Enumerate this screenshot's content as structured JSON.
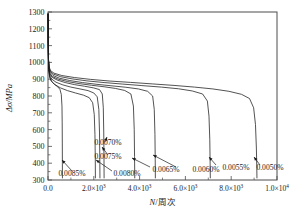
{
  "chart_data": {
    "type": "line",
    "title": "",
    "xlabel": "N/周次",
    "ylabel": "Δσ/MPa",
    "xlim": [
      0,
      10000
    ],
    "ylim": [
      300,
      1300
    ],
    "grid": false,
    "legend_position": "inline-annotations",
    "x_ticks": [
      {
        "value": 0,
        "label": "0.0"
      },
      {
        "value": 2000,
        "label": "2.0×10",
        "exp": "3"
      },
      {
        "value": 4000,
        "label": "4.0×10",
        "exp": "3"
      },
      {
        "value": 6000,
        "label": "6.0×10",
        "exp": "3"
      },
      {
        "value": 8000,
        "label": "8.0×10",
        "exp": "3"
      },
      {
        "value": 10000,
        "label": "1.0×10",
        "exp": "4"
      }
    ],
    "y_ticks": [
      {
        "value": 300,
        "label": "300"
      },
      {
        "value": 400,
        "label": "400"
      },
      {
        "value": 500,
        "label": "500"
      },
      {
        "value": 600,
        "label": "600"
      },
      {
        "value": 700,
        "label": "700"
      },
      {
        "value": 800,
        "label": "800"
      },
      {
        "value": 900,
        "label": "900"
      },
      {
        "value": 1000,
        "label": "1000"
      },
      {
        "value": 1100,
        "label": "1100"
      },
      {
        "value": 1200,
        "label": "1200"
      },
      {
        "value": 1300,
        "label": "1300"
      }
    ],
    "series": [
      {
        "name": "0.0085%",
        "label": "0.0085%",
        "failure_cycles": 620,
        "points": [
          [
            5,
            1290
          ],
          [
            12,
            1120
          ],
          [
            22,
            1010
          ],
          [
            40,
            950
          ],
          [
            70,
            915
          ],
          [
            120,
            895
          ],
          [
            200,
            880
          ],
          [
            300,
            868
          ],
          [
            420,
            855
          ],
          [
            520,
            840
          ],
          [
            580,
            810
          ],
          [
            610,
            740
          ],
          [
            620,
            640
          ],
          [
            625,
            520
          ],
          [
            628,
            400
          ],
          [
            630,
            310
          ]
        ]
      },
      {
        "name": "0.0080%",
        "label": "0.0080%",
        "failure_cycles": 2050,
        "points": [
          [
            5,
            1290
          ],
          [
            12,
            1120
          ],
          [
            22,
            1010
          ],
          [
            40,
            950
          ],
          [
            75,
            912
          ],
          [
            150,
            888
          ],
          [
            300,
            868
          ],
          [
            550,
            848
          ],
          [
            850,
            832
          ],
          [
            1200,
            818
          ],
          [
            1550,
            805
          ],
          [
            1800,
            790
          ],
          [
            1950,
            760
          ],
          [
            2020,
            690
          ],
          [
            2050,
            570
          ],
          [
            2065,
            430
          ],
          [
            2070,
            310
          ]
        ]
      },
      {
        "name": "0.0075%",
        "label": "0.0075%",
        "failure_cycles": 2250,
        "points": [
          [
            5,
            1290
          ],
          [
            12,
            1120
          ],
          [
            22,
            1010
          ],
          [
            40,
            955
          ],
          [
            80,
            920
          ],
          [
            170,
            900
          ],
          [
            350,
            882
          ],
          [
            650,
            866
          ],
          [
            1000,
            853
          ],
          [
            1400,
            842
          ],
          [
            1750,
            832
          ],
          [
            2000,
            818
          ],
          [
            2150,
            795
          ],
          [
            2220,
            720
          ],
          [
            2250,
            580
          ],
          [
            2262,
            430
          ],
          [
            2268,
            310
          ]
        ]
      },
      {
        "name": "0.0070%",
        "label": "0.0070%",
        "failure_cycles": 2420,
        "points": [
          [
            5,
            1290
          ],
          [
            12,
            1120
          ],
          [
            22,
            1012
          ],
          [
            42,
            960
          ],
          [
            85,
            928
          ],
          [
            190,
            910
          ],
          [
            400,
            895
          ],
          [
            750,
            880
          ],
          [
            1150,
            868
          ],
          [
            1600,
            858
          ],
          [
            2000,
            848
          ],
          [
            2250,
            838
          ],
          [
            2370,
            812
          ],
          [
            2415,
            730
          ],
          [
            2435,
            580
          ],
          [
            2445,
            430
          ],
          [
            2450,
            310
          ]
        ]
      },
      {
        "name": "0.0065%",
        "label": "0.0065%",
        "failure_cycles": 3750,
        "points": [
          [
            5,
            1290
          ],
          [
            12,
            1120
          ],
          [
            22,
            1012
          ],
          [
            42,
            962
          ],
          [
            90,
            932
          ],
          [
            200,
            915
          ],
          [
            450,
            900
          ],
          [
            850,
            886
          ],
          [
            1350,
            874
          ],
          [
            1900,
            864
          ],
          [
            2450,
            855
          ],
          [
            2950,
            845
          ],
          [
            3350,
            833
          ],
          [
            3620,
            812
          ],
          [
            3730,
            740
          ],
          [
            3765,
            600
          ],
          [
            3780,
            440
          ],
          [
            3788,
            310
          ]
        ]
      },
      {
        "name": "0.0060%",
        "label": "0.0060%",
        "failure_cycles": 4650,
        "points": [
          [
            5,
            1290
          ],
          [
            12,
            1120
          ],
          [
            22,
            1014
          ],
          [
            45,
            968
          ],
          [
            95,
            940
          ],
          [
            220,
            922
          ],
          [
            500,
            906
          ],
          [
            950,
            892
          ],
          [
            1500,
            880
          ],
          [
            2100,
            870
          ],
          [
            2750,
            861
          ],
          [
            3400,
            852
          ],
          [
            3950,
            842
          ],
          [
            4350,
            828
          ],
          [
            4570,
            800
          ],
          [
            4640,
            720
          ],
          [
            4670,
            570
          ],
          [
            4682,
            420
          ],
          [
            4688,
            310
          ]
        ]
      },
      {
        "name": "0.0055%",
        "label": "0.0055%",
        "failure_cycles": 7050,
        "points": [
          [
            5,
            1290
          ],
          [
            12,
            1120
          ],
          [
            22,
            1016
          ],
          [
            45,
            972
          ],
          [
            100,
            946
          ],
          [
            240,
            930
          ],
          [
            550,
            915
          ],
          [
            1050,
            902
          ],
          [
            1700,
            890
          ],
          [
            2450,
            880
          ],
          [
            3250,
            871
          ],
          [
            4100,
            862
          ],
          [
            4950,
            853
          ],
          [
            5700,
            843
          ],
          [
            6300,
            830
          ],
          [
            6750,
            812
          ],
          [
            6960,
            770
          ],
          [
            7030,
            680
          ],
          [
            7065,
            540
          ],
          [
            7080,
            400
          ],
          [
            7088,
            310
          ]
        ]
      },
      {
        "name": "0.0050%",
        "label": "0.0050%",
        "failure_cycles": 9000,
        "points": [
          [
            5,
            1290
          ],
          [
            12,
            1120
          ],
          [
            22,
            1018
          ],
          [
            45,
            976
          ],
          [
            105,
            952
          ],
          [
            260,
            936
          ],
          [
            600,
            922
          ],
          [
            1150,
            910
          ],
          [
            1850,
            899
          ],
          [
            2700,
            889
          ],
          [
            3600,
            881
          ],
          [
            4550,
            872
          ],
          [
            5500,
            863
          ],
          [
            6400,
            853
          ],
          [
            7200,
            842
          ],
          [
            7900,
            828
          ],
          [
            8450,
            810
          ],
          [
            8800,
            785
          ],
          [
            8980,
            730
          ],
          [
            9060,
            630
          ],
          [
            9100,
            490
          ],
          [
            9118,
            370
          ],
          [
            9125,
            310
          ]
        ]
      }
    ],
    "annotations": [
      {
        "label": "0.0085%",
        "text_x": 72,
        "text_y": 176,
        "tip_x": 62,
        "tip_y": 160,
        "tail_x": 72,
        "tail_y": 171
      },
      {
        "label": "0.0080%",
        "text_x": 127,
        "text_y": 176,
        "tip_x": 96,
        "tip_y": 160,
        "tail_x": 112,
        "tail_y": 171
      },
      {
        "label": "0.0075%",
        "text_x": 108,
        "text_y": 159,
        "tip_x": 102,
        "tip_y": 147,
        "tail_x": 108,
        "tail_y": 155
      },
      {
        "label": "0.0070%",
        "text_x": 108,
        "text_y": 145,
        "tip_x": 107,
        "tip_y": 137,
        "tail_x": 105,
        "tail_y": 142
      },
      {
        "label": "0.0065%",
        "text_x": 166,
        "text_y": 172,
        "tip_x": 132,
        "tip_y": 158,
        "tail_x": 150,
        "tail_y": 167
      },
      {
        "label": "0.0060%",
        "text_x": 206,
        "text_y": 172,
        "tip_x": 153,
        "tip_y": 155,
        "tail_x": 176,
        "tail_y": 167
      },
      {
        "label": "0.0055%",
        "text_x": 236,
        "text_y": 170,
        "tip_x": 209,
        "tip_y": 157,
        "tail_x": 216,
        "tail_y": 165
      },
      {
        "label": "0.0050%",
        "text_x": 270,
        "text_y": 170,
        "tip_x": 254,
        "tip_y": 157,
        "tail_x": 260,
        "tail_y": 165
      }
    ],
    "colors": {
      "curve": "#1a1a1a",
      "axis": "#4d4d4d",
      "text": "#1a1a1a",
      "background": "#ffffff"
    }
  }
}
